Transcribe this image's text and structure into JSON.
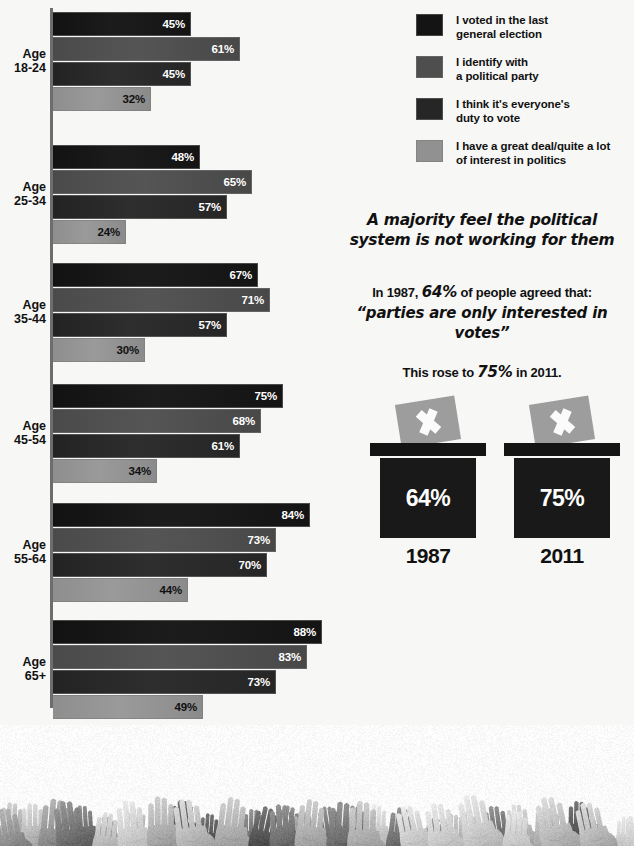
{
  "background_color": "#f7f7f6",
  "chart_data": {
    "type": "bar",
    "orientation": "horizontal",
    "title": "",
    "xlabel": "",
    "ylabel": "",
    "xlim": [
      0,
      100
    ],
    "grid": false,
    "legend_position": "top-right",
    "categories": [
      "Age 18-24",
      "Age 25-34",
      "Age 35-44",
      "Age 45-54",
      "Age 55-64",
      "Age 65+"
    ],
    "series": [
      {
        "name": "I voted in the last general election",
        "color": "#141414",
        "values": [
          45,
          48,
          67,
          75,
          84,
          88
        ]
      },
      {
        "name": "I identify with a political party",
        "color": "#4e4e4e",
        "values": [
          61,
          65,
          71,
          68,
          73,
          83
        ]
      },
      {
        "name": "I think it's everyone's duty to vote",
        "color": "#262626",
        "values": [
          45,
          57,
          57,
          61,
          70,
          73
        ]
      },
      {
        "name": "I have a great deal/quite a lot of interest in politics",
        "color": "#919191",
        "values": [
          32,
          24,
          30,
          34,
          44,
          49
        ]
      }
    ],
    "value_suffix": "%"
  },
  "groups": [
    {
      "label_lines": [
        "Age",
        "18-24"
      ],
      "values": [
        "45%",
        "61%",
        "45%",
        "32%"
      ]
    },
    {
      "label_lines": [
        "Age",
        "25-34"
      ],
      "values": [
        "48%",
        "65%",
        "57%",
        "24%"
      ]
    },
    {
      "label_lines": [
        "Age",
        "35-44"
      ],
      "values": [
        "67%",
        "71%",
        "57%",
        "30%"
      ]
    },
    {
      "label_lines": [
        "Age",
        "45-54"
      ],
      "values": [
        "75%",
        "68%",
        "61%",
        "34%"
      ]
    },
    {
      "label_lines": [
        "Age",
        "55-64"
      ],
      "values": [
        "84%",
        "73%",
        "70%",
        "44%"
      ]
    },
    {
      "label_lines": [
        "Age",
        "65+"
      ],
      "values": [
        "88%",
        "83%",
        "73%",
        "49%"
      ]
    }
  ],
  "legend": {
    "items": [
      {
        "color": "#141414",
        "lines": [
          "I voted in the last",
          "general election"
        ]
      },
      {
        "color": "#4e4e4e",
        "lines": [
          "I identify with",
          "a political party"
        ]
      },
      {
        "color": "#262626",
        "lines": [
          "I think it's everyone's",
          "duty to vote"
        ]
      },
      {
        "color": "#919191",
        "lines": [
          "I have a great deal/quite a lot",
          "of interest in politics"
        ]
      }
    ]
  },
  "statement": {
    "majority_lines": [
      "A majority feel the political",
      "system is not working for them"
    ],
    "agree_prefix": "In 1987, ",
    "agree_pct": "64%",
    "agree_suffix": " of people agreed that:",
    "quote": "“parties are only interested in votes”",
    "rose_prefix": "This rose to ",
    "rose_pct": "75%",
    "rose_suffix": " in 2011."
  },
  "ballots": [
    {
      "pct": "64%",
      "year": "1987"
    },
    {
      "pct": "75%",
      "year": "2011"
    }
  ],
  "photo": {
    "description": "raised hands crowd",
    "alt": "Black and white photograph of many raised hands"
  }
}
